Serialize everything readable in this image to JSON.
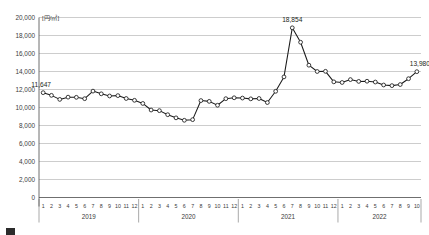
{
  "chart_data": {
    "type": "line",
    "title": "",
    "subtitle": "",
    "unit_label": "[円/㎡]",
    "xlabel": "",
    "ylabel": "",
    "ylim": [
      0,
      20000
    ],
    "ytick_step": 2000,
    "ytick_labels": [
      "20,000",
      "18,000",
      "16,000",
      "14,000",
      "12,000",
      "10,000",
      "8,000",
      "6,000",
      "4,000",
      "2,000",
      "0"
    ],
    "ytick_values": [
      20000,
      18000,
      16000,
      14000,
      12000,
      10000,
      8000,
      6000,
      4000,
      2000,
      0
    ],
    "grid": true,
    "legend": "none",
    "marker": "open-circle",
    "line_color": "#1a1a1a",
    "grid_color": "#9a9a9a",
    "year_groups": [
      {
        "year": "2019",
        "months": [
          "1",
          "2",
          "3",
          "4",
          "5",
          "6",
          "7",
          "8",
          "9",
          "10",
          "11",
          "12"
        ]
      },
      {
        "year": "2020",
        "months": [
          "1",
          "2",
          "3",
          "4",
          "5",
          "6",
          "7",
          "8",
          "9",
          "10",
          "11",
          "12"
        ]
      },
      {
        "year": "2021",
        "months": [
          "1",
          "2",
          "3",
          "4",
          "5",
          "6",
          "7",
          "8",
          "9",
          "10",
          "11",
          "12"
        ]
      },
      {
        "year": "2022",
        "months": [
          "1",
          "2",
          "3",
          "4",
          "5",
          "6",
          "7",
          "8",
          "9",
          "10"
        ]
      }
    ],
    "categories": [
      "2019-1",
      "2019-2",
      "2019-3",
      "2019-4",
      "2019-5",
      "2019-6",
      "2019-7",
      "2019-8",
      "2019-9",
      "2019-10",
      "2019-11",
      "2019-12",
      "2020-1",
      "2020-2",
      "2020-3",
      "2020-4",
      "2020-5",
      "2020-6",
      "2020-7",
      "2020-8",
      "2020-9",
      "2020-10",
      "2020-11",
      "2020-12",
      "2021-1",
      "2021-2",
      "2021-3",
      "2021-4",
      "2021-5",
      "2021-6",
      "2021-7",
      "2021-8",
      "2021-9",
      "2021-10",
      "2021-11",
      "2021-12",
      "2022-1",
      "2022-2",
      "2022-3",
      "2022-4",
      "2022-5",
      "2022-6",
      "2022-7",
      "2022-8",
      "2022-9",
      "2022-10"
    ],
    "values": [
      11647,
      11350,
      10900,
      11150,
      11130,
      10980,
      11820,
      11520,
      11280,
      11320,
      11000,
      10800,
      10450,
      9720,
      9650,
      9200,
      8850,
      8580,
      8650,
      10770,
      10680,
      10250,
      10980,
      11080,
      11050,
      10960,
      11000,
      10550,
      11800,
      13400,
      18854,
      17250,
      14700,
      14000,
      14020,
      12850,
      12780,
      13100,
      12900,
      12920,
      12830,
      12500,
      12430,
      12550,
      13200,
      13980
    ],
    "annotations": [
      {
        "label": "11,647",
        "index": 0,
        "position": "above-left"
      },
      {
        "label": "18,854",
        "index": 30,
        "position": "above"
      },
      {
        "label": "13,980",
        "index": 45,
        "position": "above-right"
      }
    ]
  },
  "caption": {
    "text": ""
  }
}
